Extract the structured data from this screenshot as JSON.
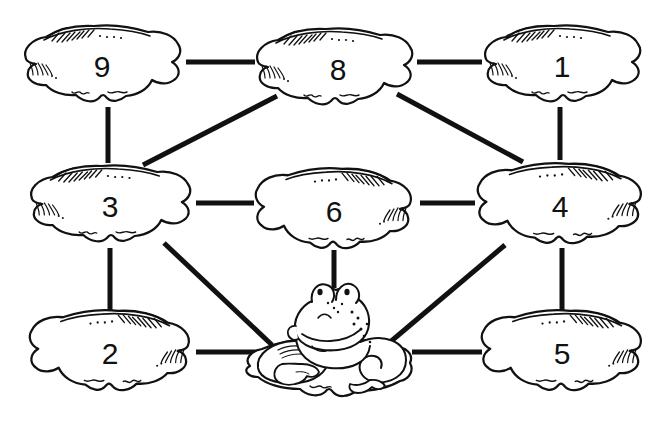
{
  "page": {
    "background_color": "#ffffff",
    "ink_color": "#111111",
    "width": 671,
    "height": 433
  },
  "nodes": [
    {
      "id": "pad9",
      "label": "9",
      "cx": 102,
      "cy": 65,
      "rx": 78,
      "ry": 38,
      "style": "left-hatch",
      "label_dx": 0,
      "label_dy": 2
    },
    {
      "id": "pad8",
      "label": "8",
      "cx": 334,
      "cy": 68,
      "rx": 78,
      "ry": 38,
      "style": "left-hatch",
      "label_dx": 4,
      "label_dy": 2
    },
    {
      "id": "pad1",
      "label": "1",
      "cx": 562,
      "cy": 65,
      "rx": 78,
      "ry": 38,
      "style": "left-hatch",
      "label_dx": 0,
      "label_dy": 2
    },
    {
      "id": "pad3",
      "label": "3",
      "cx": 110,
      "cy": 205,
      "rx": 80,
      "ry": 38,
      "style": "left-hatch",
      "label_dx": 0,
      "label_dy": 2
    },
    {
      "id": "pad6",
      "label": "6",
      "cx": 334,
      "cy": 210,
      "rx": 78,
      "ry": 40,
      "style": "right-hatch",
      "label_dx": 0,
      "label_dy": 2
    },
    {
      "id": "pad4",
      "label": "4",
      "cx": 560,
      "cy": 205,
      "rx": 82,
      "ry": 40,
      "style": "right-hatch",
      "label_dx": 0,
      "label_dy": 2
    },
    {
      "id": "pad2",
      "label": "2",
      "cx": 110,
      "cy": 352,
      "rx": 80,
      "ry": 40,
      "style": "right-hatch",
      "label_dx": 0,
      "label_dy": 2
    },
    {
      "id": "pad5",
      "label": "5",
      "cx": 562,
      "cy": 352,
      "rx": 80,
      "ry": 40,
      "style": "right-hatch",
      "label_dx": 0,
      "label_dy": 2
    },
    {
      "id": "padfrog",
      "label": "",
      "cx": 330,
      "cy": 360,
      "rx": 82,
      "ry": 38,
      "style": "frog",
      "label_dx": 0,
      "label_dy": 0
    }
  ],
  "edges": [
    {
      "id": "e-9-8",
      "from": "pad9",
      "to": "pad8",
      "x1": 186,
      "y1": 62,
      "x2": 255,
      "y2": 62
    },
    {
      "id": "e-8-1",
      "from": "pad8",
      "to": "pad1",
      "x1": 417,
      "y1": 62,
      "x2": 482,
      "y2": 62
    },
    {
      "id": "e-9-3",
      "from": "pad9",
      "to": "pad3",
      "x1": 108,
      "y1": 107,
      "x2": 108,
      "y2": 163
    },
    {
      "id": "e-1-4",
      "from": "pad1",
      "to": "pad4",
      "x1": 560,
      "y1": 107,
      "x2": 560,
      "y2": 160
    },
    {
      "id": "e-3-8",
      "from": "pad3",
      "to": "pad8",
      "x1": 143,
      "y1": 165,
      "x2": 277,
      "y2": 96
    },
    {
      "id": "e-8-4",
      "from": "pad8",
      "to": "pad4",
      "x1": 397,
      "y1": 94,
      "x2": 523,
      "y2": 162
    },
    {
      "id": "e-3-6",
      "from": "pad3",
      "to": "pad6",
      "x1": 196,
      "y1": 203,
      "x2": 254,
      "y2": 203
    },
    {
      "id": "e-6-4",
      "from": "pad6",
      "to": "pad4",
      "x1": 420,
      "y1": 203,
      "x2": 475,
      "y2": 203
    },
    {
      "id": "e-3-2",
      "from": "pad3",
      "to": "pad2",
      "x1": 110,
      "y1": 248,
      "x2": 110,
      "y2": 312
    },
    {
      "id": "e-6-frog",
      "from": "pad6",
      "to": "padfrog",
      "x1": 334,
      "y1": 250,
      "x2": 334,
      "y2": 288
    },
    {
      "id": "e-4-5",
      "from": "pad4",
      "to": "pad5",
      "x1": 562,
      "y1": 248,
      "x2": 562,
      "y2": 312
    },
    {
      "id": "e-3-frog",
      "from": "pad3",
      "to": "padfrog",
      "x1": 164,
      "y1": 243,
      "x2": 272,
      "y2": 345
    },
    {
      "id": "e-4-frog",
      "from": "pad4",
      "to": "padfrog",
      "x1": 505,
      "y1": 245,
      "x2": 389,
      "y2": 343
    },
    {
      "id": "e-2-frog",
      "from": "pad2",
      "to": "padfrog",
      "x1": 196,
      "y1": 352,
      "x2": 268,
      "y2": 352
    },
    {
      "id": "e-frog-5",
      "from": "padfrog",
      "to": "pad5",
      "x1": 412,
      "y1": 352,
      "x2": 482,
      "y2": 352
    }
  ],
  "frog": {
    "id": "frog-figure",
    "description": "Cartoon frog with bulging eyes sitting on the central lily pad",
    "cx": 330,
    "cy": 340
  },
  "styles": {
    "edge_width": 5,
    "pad_outline_width": 2.2,
    "hatch_width": 1.2
  }
}
